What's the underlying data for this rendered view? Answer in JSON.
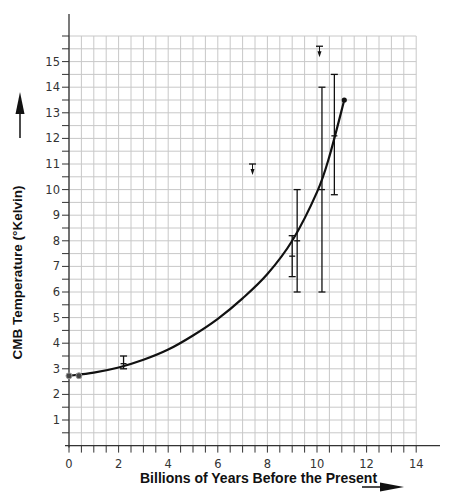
{
  "chart_data": {
    "type": "scatter",
    "title": "",
    "xlabel": "Billions of Years Before the Present",
    "ylabel": "CMB Temperature (°Kelvin)",
    "xlim": [
      0,
      14
    ],
    "ylim": [
      0,
      16
    ],
    "x_ticks": [
      0,
      2,
      4,
      6,
      8,
      10,
      12,
      14
    ],
    "y_ticks": [
      1,
      2,
      3,
      4,
      5,
      6,
      7,
      8,
      9,
      10,
      11,
      12,
      13,
      14,
      15
    ],
    "grid": true,
    "grid_minor_step_x": 0.5,
    "grid_minor_step_y": 0.5,
    "legend": null,
    "series": [
      {
        "name": "Measurements",
        "type": "errorbar",
        "points": [
          {
            "x": 0.0,
            "y": 2.725,
            "ylow": 2.725,
            "yhigh": 2.725
          },
          {
            "x": 0.4,
            "y": 2.73,
            "ylow": 2.73,
            "yhigh": 2.73
          },
          {
            "x": 2.2,
            "y": 3.2,
            "ylow": 3.0,
            "yhigh": 3.5
          },
          {
            "x": 9.0,
            "y": 7.4,
            "ylow": 6.6,
            "yhigh": 8.2
          },
          {
            "x": 9.2,
            "y": 8.0,
            "ylow": 6.0,
            "yhigh": 10.0
          },
          {
            "x": 10.2,
            "y": 10.0,
            "ylow": 6.0,
            "yhigh": 14.0
          },
          {
            "x": 10.7,
            "y": 12.1,
            "ylow": 9.8,
            "yhigh": 14.5
          }
        ]
      },
      {
        "name": "Upper limits",
        "type": "upper-limit",
        "points": [
          {
            "x": 7.4,
            "y": 11.0
          },
          {
            "x": 10.1,
            "y": 15.6
          }
        ]
      },
      {
        "name": "Predicted curve T = 2.725(1+z)",
        "type": "line",
        "x": [
          0,
          1,
          2,
          3,
          4,
          5,
          6,
          7,
          8,
          9,
          10,
          10.5,
          11.1
        ],
        "y": [
          2.725,
          2.85,
          3.05,
          3.35,
          3.75,
          4.3,
          4.95,
          5.75,
          6.7,
          8.0,
          9.9,
          11.3,
          13.5
        ]
      }
    ]
  },
  "axes": {
    "x_tick_labels": [
      "0",
      "2",
      "4",
      "6",
      "8",
      "10",
      "12",
      "14"
    ],
    "y_tick_labels": [
      "1",
      "2",
      "3",
      "4",
      "5",
      "6",
      "7",
      "8",
      "9",
      "10",
      "11",
      "12",
      "13",
      "14",
      "15"
    ],
    "xlabel": "Billions of Years Before the Present",
    "ylabel": "CMB Temperature (°Kelvin)"
  },
  "colors": {
    "grid": "#c8c8c8",
    "axis": "#333333",
    "data": "#111111",
    "background": "#ffffff"
  }
}
